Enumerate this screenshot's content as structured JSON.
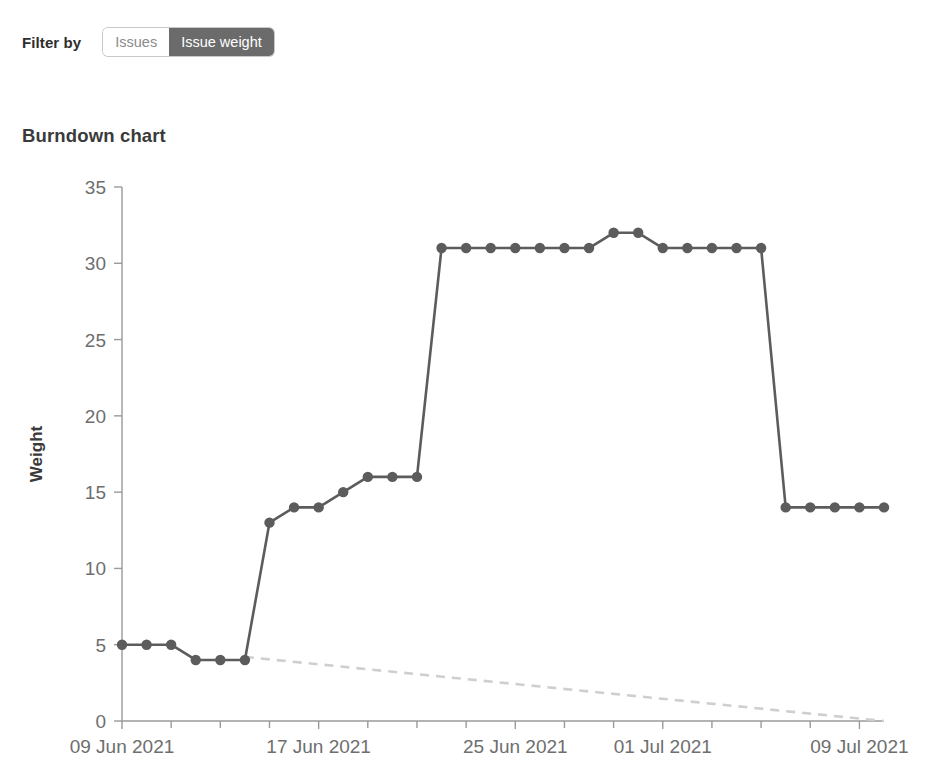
{
  "filter": {
    "label": "Filter by",
    "options": [
      {
        "label": "Issues",
        "active": false
      },
      {
        "label": "Issue weight",
        "active": true
      }
    ]
  },
  "heading": "Burndown chart",
  "colors": {
    "series": "#5c5c5c",
    "guide": "#cfcfcf",
    "axis": "#9a9a9a",
    "tick_text": "#6e6e6e",
    "toggle_active_bg": "#6b6b6b",
    "toggle_active_text": "#ffffff",
    "toggle_inactive_bg": "#ffffff",
    "toggle_inactive_text": "#8a8a8a"
  },
  "chart_data": {
    "type": "line",
    "title": "Burndown chart",
    "xlabel": "",
    "ylabel": "Weight",
    "ylim": [
      0,
      35
    ],
    "yticks": [
      0,
      5,
      10,
      15,
      20,
      25,
      30,
      35
    ],
    "xlim": [
      "2021-06-09",
      "2021-07-11"
    ],
    "xticks": [
      "09 Jun 2021",
      "17 Jun 2021",
      "25 Jun 2021",
      "01 Jul 2021",
      "09 Jul 2021"
    ],
    "xtick_positions_days": [
      0,
      8,
      16,
      22,
      30
    ],
    "grid": false,
    "legend": false,
    "series": [
      {
        "name": "Actual weight remaining",
        "style": "solid-with-markers",
        "color": "#5c5c5c",
        "x_days": [
          0,
          1,
          2,
          3,
          4,
          5,
          6,
          7,
          8,
          9,
          10,
          11,
          12,
          13,
          14,
          15,
          16,
          17,
          18,
          19,
          20,
          21,
          22,
          23,
          24,
          25,
          26,
          27,
          28,
          29,
          30,
          31
        ],
        "x_labels": [
          "09 Jun 2021",
          "10 Jun 2021",
          "11 Jun 2021",
          "12 Jun 2021",
          "13 Jun 2021",
          "14 Jun 2021",
          "15 Jun 2021",
          "16 Jun 2021",
          "17 Jun 2021",
          "18 Jun 2021",
          "19 Jun 2021",
          "20 Jun 2021",
          "21 Jun 2021",
          "22 Jun 2021",
          "23 Jun 2021",
          "24 Jun 2021",
          "25 Jun 2021",
          "26 Jun 2021",
          "27 Jun 2021",
          "28 Jun 2021",
          "29 Jun 2021",
          "30 Jun 2021",
          "01 Jul 2021",
          "02 Jul 2021",
          "03 Jul 2021",
          "04 Jul 2021",
          "05 Jul 2021",
          "06 Jul 2021",
          "07 Jul 2021",
          "08 Jul 2021",
          "09 Jul 2021",
          "10 Jul 2021"
        ],
        "values": [
          5,
          5,
          5,
          4,
          4,
          4,
          13,
          14,
          14,
          15,
          16,
          16,
          16,
          31,
          31,
          31,
          31,
          31,
          31,
          31,
          32,
          32,
          31,
          31,
          31,
          31,
          31,
          14,
          14,
          14,
          14,
          14
        ]
      },
      {
        "name": "Ideal burndown guideline",
        "style": "dashed",
        "color": "#cfcfcf",
        "x_days": [
          5,
          31
        ],
        "values": [
          4.2,
          0
        ]
      }
    ]
  }
}
